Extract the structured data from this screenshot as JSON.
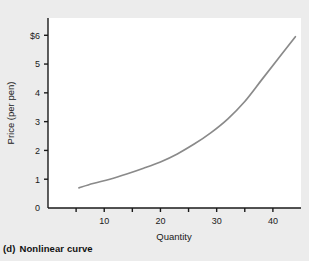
{
  "figure": {
    "caption_letter": "(d)",
    "caption_text": "Nonlinear curve",
    "background_color": "#ececec",
    "plot_background_color": "#ffffff"
  },
  "chart_data": {
    "type": "line",
    "title": "",
    "subtitle": "",
    "xlabel": "Quantity",
    "ylabel": "Price (per pen)",
    "xlim": [
      0,
      45
    ],
    "ylim": [
      0,
      6.6
    ],
    "grid": false,
    "legend": null,
    "legend_position": "none",
    "line_color": "#8a8a8a",
    "axis_color": "#1a1a1a",
    "x_tick_labels": [
      "10",
      "20",
      "30",
      "40"
    ],
    "x_tick_values": [
      10,
      20,
      30,
      40
    ],
    "x_minor_tick_values": [
      5,
      15,
      25,
      35
    ],
    "y_tick_labels": [
      "0",
      "1",
      "2",
      "3",
      "4",
      "5",
      "$6"
    ],
    "y_tick_values": [
      0,
      1,
      2,
      3,
      4,
      5,
      6
    ],
    "series": [
      {
        "name": "Price curve",
        "x": [
          5.5,
          8,
          11,
          14,
          17,
          20,
          23,
          26,
          29,
          32,
          35,
          38,
          41,
          44
        ],
        "y": [
          0.7,
          0.85,
          1.0,
          1.18,
          1.38,
          1.6,
          1.88,
          2.22,
          2.62,
          3.1,
          3.7,
          4.45,
          5.2,
          5.95
        ]
      }
    ],
    "annotations": []
  }
}
